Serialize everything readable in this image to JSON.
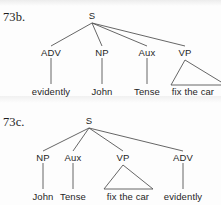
{
  "page": {
    "width": 221,
    "height": 205,
    "background": "#fdfdfd",
    "ink_color": "#1f1f1f",
    "line_color": "#555555"
  },
  "trees": [
    {
      "id": "73b",
      "example_label": "73b.",
      "root": {
        "label": "S",
        "x": 92,
        "y": 17
      },
      "branch_origin": {
        "x": 92,
        "y": 23
      },
      "nodes": [
        {
          "label": "ADV",
          "x": 51,
          "y": 54
        },
        {
          "label": "NP",
          "x": 102,
          "y": 54
        },
        {
          "label": "Aux",
          "x": 147,
          "y": 54
        },
        {
          "label": "VP",
          "x": 185,
          "y": 54
        }
      ],
      "terminals": [
        {
          "label": "evidently",
          "x": 51,
          "y": 93,
          "kind": "line"
        },
        {
          "label": "John",
          "x": 102,
          "y": 93,
          "kind": "line"
        },
        {
          "label": "Tense",
          "x": 147,
          "y": 93,
          "kind": "line"
        },
        {
          "label": "fix the car",
          "x": 193,
          "y": 93,
          "kind": "triangle"
        }
      ],
      "triangle": {
        "apex_x": 185,
        "apex_y": 60,
        "left_x": 171,
        "right_x": 226,
        "base_y": 85
      }
    },
    {
      "id": "73c",
      "example_label": "73c.",
      "root": {
        "label": "S",
        "x": 89,
        "y": 122
      },
      "branch_origin": {
        "x": 89,
        "y": 128
      },
      "nodes": [
        {
          "label": "NP",
          "x": 43,
          "y": 159
        },
        {
          "label": "Aux",
          "x": 73,
          "y": 159
        },
        {
          "label": "VP",
          "x": 123,
          "y": 159
        },
        {
          "label": "ADV",
          "x": 183,
          "y": 159
        }
      ],
      "terminals": [
        {
          "label": "John",
          "x": 43,
          "y": 198,
          "kind": "line"
        },
        {
          "label": "Tense",
          "x": 73,
          "y": 198,
          "kind": "line"
        },
        {
          "label": "fix the car",
          "x": 128,
          "y": 198,
          "kind": "triangle"
        },
        {
          "label": "evidently",
          "x": 183,
          "y": 198,
          "kind": "line"
        }
      ],
      "triangle": {
        "apex_x": 123,
        "apex_y": 165,
        "left_x": 104,
        "right_x": 153,
        "base_y": 189
      }
    }
  ]
}
